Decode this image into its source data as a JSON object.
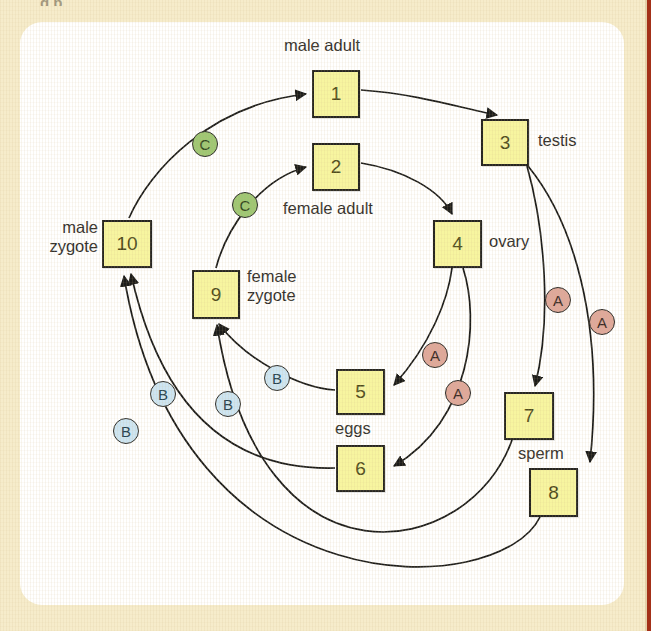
{
  "page": {
    "background_color": "#f6eccb",
    "panel_color": "#ffffff",
    "stripe_color": "#a33018",
    "cut_off_top_text": "g     p"
  },
  "diagram": {
    "type": "life-cycle-flow",
    "box_fill": "#f7f5a0",
    "box_stroke": "#262521",
    "marker_colors": {
      "A": "#dfa89b",
      "B": "#cde5f2",
      "C": "#9ec773"
    },
    "boxes": [
      {
        "id": "box1",
        "label": "1",
        "x": 312,
        "y": 70,
        "w": 48,
        "h": 48
      },
      {
        "id": "box2",
        "label": "2",
        "x": 312,
        "y": 143,
        "w": 48,
        "h": 48
      },
      {
        "id": "box3",
        "label": "3",
        "x": 481,
        "y": 119,
        "w": 48,
        "h": 47
      },
      {
        "id": "box4",
        "label": "4",
        "x": 433,
        "y": 220,
        "w": 49,
        "h": 48
      },
      {
        "id": "box5",
        "label": "5",
        "x": 336,
        "y": 369,
        "w": 49,
        "h": 46
      },
      {
        "id": "box6",
        "label": "6",
        "x": 336,
        "y": 445,
        "w": 49,
        "h": 47
      },
      {
        "id": "box7",
        "label": "7",
        "x": 504,
        "y": 392,
        "w": 50,
        "h": 48
      },
      {
        "id": "box8",
        "label": "8",
        "x": 529,
        "y": 468,
        "w": 49,
        "h": 49
      },
      {
        "id": "box9",
        "label": "9",
        "x": 192,
        "y": 270,
        "w": 48,
        "h": 49
      },
      {
        "id": "box10",
        "label": "10",
        "x": 102,
        "y": 220,
        "w": 50,
        "h": 48
      }
    ],
    "captions": [
      {
        "id": "caption-male-adult",
        "text": "male adult",
        "x": 284,
        "y": 36,
        "w": 110,
        "align": "left"
      },
      {
        "id": "caption-testis",
        "text": "testis",
        "x": 538,
        "y": 131,
        "w": 70,
        "align": "left"
      },
      {
        "id": "caption-female-adult",
        "text": "female adult",
        "x": 283,
        "y": 199,
        "w": 130,
        "align": "left"
      },
      {
        "id": "caption-ovary",
        "text": "ovary",
        "x": 489,
        "y": 232,
        "w": 70,
        "align": "left"
      },
      {
        "id": "caption-male-zygote",
        "text": "male\nzygote",
        "x": 20,
        "y": 218,
        "w": 78,
        "align": "right"
      },
      {
        "id": "caption-female-zygote",
        "text": "female\nzygote",
        "x": 247,
        "y": 267,
        "w": 90,
        "align": "left"
      },
      {
        "id": "caption-eggs",
        "text": "eggs",
        "x": 335,
        "y": 419,
        "w": 52,
        "align": "left"
      },
      {
        "id": "caption-sperm",
        "text": "sperm",
        "x": 518,
        "y": 444,
        "w": 62,
        "align": "left"
      }
    ],
    "markers": [
      {
        "id": "marker-c-1",
        "label": "C",
        "kind": "C",
        "cx": 205,
        "cy": 144
      },
      {
        "id": "marker-c-2",
        "label": "C",
        "kind": "C",
        "cx": 245,
        "cy": 205
      },
      {
        "id": "marker-a-1",
        "label": "A",
        "kind": "A",
        "cx": 435,
        "cy": 355
      },
      {
        "id": "marker-a-2",
        "label": "A",
        "kind": "A",
        "cx": 458,
        "cy": 393
      },
      {
        "id": "marker-a-3",
        "label": "A",
        "kind": "A",
        "cx": 558,
        "cy": 300
      },
      {
        "id": "marker-a-4",
        "label": "A",
        "kind": "A",
        "cx": 602,
        "cy": 322
      },
      {
        "id": "marker-b-1",
        "label": "B",
        "kind": "B",
        "cx": 277,
        "cy": 378
      },
      {
        "id": "marker-b-2",
        "label": "B",
        "kind": "B",
        "cx": 228,
        "cy": 404
      },
      {
        "id": "marker-b-3",
        "label": "B",
        "kind": "B",
        "cx": 163,
        "cy": 394
      },
      {
        "id": "marker-b-4",
        "label": "B",
        "kind": "B",
        "cx": 126,
        "cy": 431
      }
    ]
  }
}
